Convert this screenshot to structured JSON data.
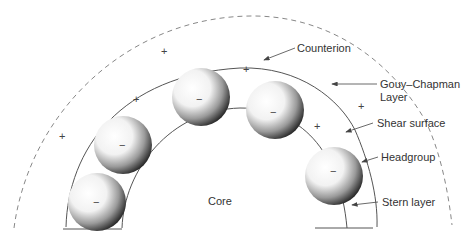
{
  "diagram": {
    "type": "micelle-cross-section",
    "labels": {
      "counterion": "Counterion",
      "gouy_chapman_1": "Gouy–Chapman",
      "gouy_chapman_2": "Layer",
      "shear_surface": "Shear surface",
      "headgroup": "Headgroup",
      "stern_layer": "Stern layer",
      "core": "Core"
    },
    "headgroup_charge": "−",
    "counterion_charge": "+",
    "headgroup_count": 5,
    "counterion_count": 6,
    "colors": {
      "line": "#555555",
      "dashed": "#888888",
      "text": "#333333"
    }
  }
}
